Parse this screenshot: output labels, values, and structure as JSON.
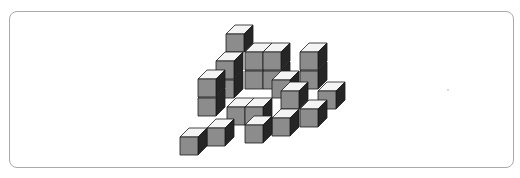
{
  "figure": {
    "colors": {
      "top_face": "#f4f4f4",
      "front_face": "#8c8c8c",
      "side_face": "#262626",
      "edge": "#1a1a1a",
      "frame_border": "#a9a9a9"
    },
    "cube_size": 18,
    "depth_offset": [
      9,
      -9
    ],
    "cubes": [
      {
        "x": 245,
        "y": 71
      },
      {
        "x": 263,
        "y": 71
      },
      {
        "x": 300,
        "y": 71
      },
      {
        "x": 245,
        "y": 52
      },
      {
        "x": 263,
        "y": 52
      },
      {
        "x": 300,
        "y": 52
      },
      {
        "x": 226,
        "y": 34
      },
      {
        "x": 216,
        "y": 80
      },
      {
        "x": 216,
        "y": 61
      },
      {
        "x": 272,
        "y": 80
      },
      {
        "x": 318,
        "y": 91
      },
      {
        "x": 198,
        "y": 98
      },
      {
        "x": 198,
        "y": 79
      },
      {
        "x": 227,
        "y": 107
      },
      {
        "x": 245,
        "y": 107
      },
      {
        "x": 281,
        "y": 91
      },
      {
        "x": 300,
        "y": 109
      },
      {
        "x": 272,
        "y": 118
      },
      {
        "x": 207,
        "y": 128
      },
      {
        "x": 245,
        "y": 125
      },
      {
        "x": 180,
        "y": 137
      }
    ]
  }
}
